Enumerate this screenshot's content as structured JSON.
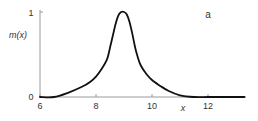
{
  "chart_data": {
    "type": "line",
    "title": "",
    "panel_label": "a",
    "xlabel": "x",
    "ylabel": "m(x)",
    "xlim": [
      6,
      13.3
    ],
    "ylim": [
      0,
      1
    ],
    "xticks": [
      6,
      8,
      10,
      12
    ],
    "xtick_labels": [
      "6",
      "8",
      "10",
      "12"
    ],
    "yticks": [
      0,
      1
    ],
    "ytick_labels": [
      "0",
      "1"
    ],
    "grid": false,
    "legend": null,
    "series": [
      {
        "name": "m(x)",
        "color": "#111111",
        "x": [
          6.0,
          6.5,
          7.0,
          7.5,
          7.8,
          8.0,
          8.2,
          8.4,
          8.5,
          8.6,
          8.7,
          8.8,
          8.9,
          9.0,
          9.1,
          9.2,
          9.3,
          9.4,
          9.5,
          9.6,
          9.8,
          10.0,
          10.3,
          10.6,
          11.0,
          11.5,
          12.0,
          12.5,
          13.3
        ],
        "y": [
          0.0,
          0.0,
          0.05,
          0.12,
          0.18,
          0.24,
          0.33,
          0.45,
          0.58,
          0.72,
          0.86,
          0.96,
          1.0,
          1.0,
          0.97,
          0.88,
          0.74,
          0.58,
          0.46,
          0.37,
          0.27,
          0.2,
          0.13,
          0.07,
          0.02,
          0.0,
          0.0,
          0.0,
          0.0
        ]
      }
    ]
  },
  "labels": {
    "panel": "a",
    "ylabel": "m(x)",
    "xlabel": "x",
    "xticks": [
      "6",
      "8",
      "10",
      "12"
    ],
    "yticks": [
      "0",
      "1"
    ]
  }
}
